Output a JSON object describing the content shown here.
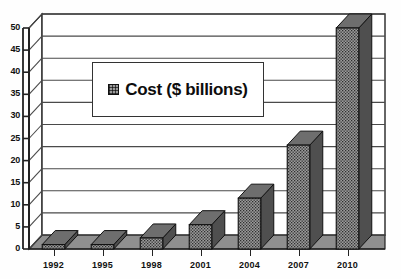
{
  "chart_data": {
    "type": "bar",
    "title": "",
    "subtitle": "",
    "xlabel": "",
    "ylabel": "",
    "categories": [
      "1992",
      "1995",
      "1998",
      "2001",
      "2004",
      "2007",
      "2010"
    ],
    "values": [
      1,
      1,
      2.5,
      5.5,
      11.5,
      23.5,
      50
    ],
    "series": [
      {
        "name": "Cost ($ billions)",
        "values": [
          1,
          1,
          2.5,
          5.5,
          11.5,
          23.5,
          50
        ]
      }
    ],
    "ylim": [
      0,
      50
    ],
    "ytick_labels": [
      "0",
      "5",
      "10",
      "15",
      "20",
      "25",
      "30",
      "35",
      "40",
      "45",
      "50"
    ],
    "ytick_values": [
      0,
      5,
      10,
      15,
      20,
      25,
      30,
      35,
      40,
      45,
      50
    ],
    "grid": true,
    "grid_axis": "y",
    "legend": {
      "position": "upper-left-inside",
      "entries": [
        {
          "label": "Cost ($ billions)",
          "swatch": "hatched-gray"
        }
      ]
    },
    "style": "3d-column",
    "colors": {
      "bar_face": "#9b9b9b",
      "bar_side": "#4f4f4f",
      "bar_top": "#6e6e6e",
      "floor": "#8f8f8f",
      "axis": "#222222",
      "grid": "#4a4a4a",
      "background": "#ffffff"
    }
  }
}
